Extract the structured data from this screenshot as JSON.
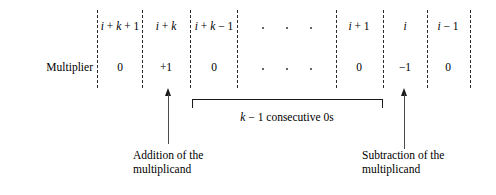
{
  "figure": {
    "type": "booth-recoding-bit-pattern-diagram",
    "row_label": "Multiplier",
    "columns": [
      {
        "index_label": "i + k + 1",
        "value": "0"
      },
      {
        "index_label": "i + k",
        "value": "+1"
      },
      {
        "index_label": "i + k − 1",
        "value": "0"
      },
      {
        "index_label": "· · ·",
        "value": "· · ·"
      },
      {
        "index_label": "i + 1",
        "value": "0"
      },
      {
        "index_label": "i",
        "value": "−1"
      },
      {
        "index_label": "i − 1",
        "value": "0"
      }
    ],
    "bracket_caption": "k − 1 consecutive 0s",
    "annotations": [
      {
        "line1": "Addition of the",
        "line2": "multiplicand"
      },
      {
        "line1": "Subtraction of the",
        "line2": "multiplicand"
      }
    ],
    "colors": {
      "ink": "#000000",
      "divider": "#2b2b2b",
      "arrow": "#1a1a1a",
      "background": "#ffffff"
    }
  }
}
